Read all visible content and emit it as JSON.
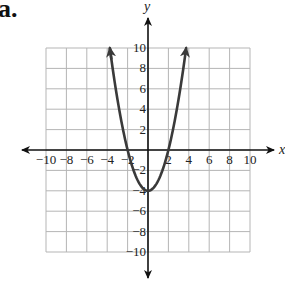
{
  "problem_label": "a.",
  "chart_data": {
    "type": "line",
    "title": "",
    "function": "y = x^2 - 4",
    "xlabel": "x",
    "ylabel": "y",
    "xlim": [
      -10,
      10
    ],
    "ylim": [
      -10,
      10
    ],
    "grid": true,
    "grid_step": 2,
    "x_ticks": [
      -10,
      -8,
      -6,
      -4,
      -2,
      2,
      4,
      6,
      8,
      10
    ],
    "y_ticks": [
      10,
      8,
      6,
      4,
      2,
      -2,
      -4,
      -6,
      -8,
      -10
    ],
    "series": [
      {
        "name": "parabola",
        "x": [
          -3.74,
          -3,
          -2,
          -1,
          0,
          1,
          2,
          3,
          3.74
        ],
        "values": [
          10,
          5,
          0,
          -3,
          -4,
          -3,
          0,
          5,
          10
        ]
      }
    ],
    "key_points": {
      "vertex": [
        0,
        -4
      ],
      "x_intercepts": [
        [
          -2,
          0
        ],
        [
          2,
          0
        ]
      ],
      "y_intercept": [
        0,
        -4
      ]
    },
    "colors": {
      "curve": "#3a3a3a",
      "grid": "#b5b5b5",
      "axes": "#111111"
    }
  }
}
